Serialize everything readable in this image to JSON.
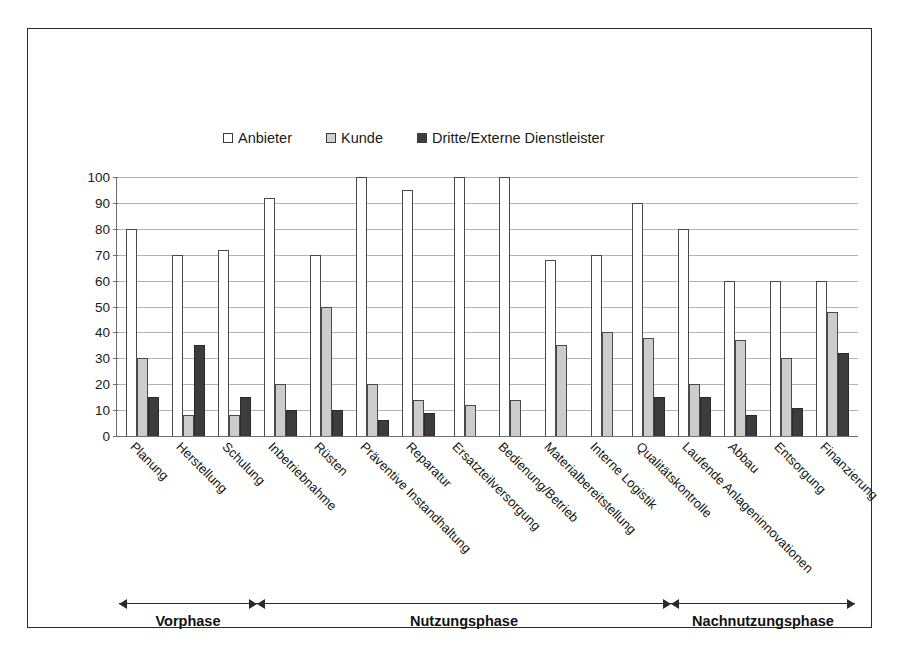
{
  "chart_data": {
    "type": "bar",
    "title": "",
    "xlabel": "",
    "ylabel": "",
    "ylim": [
      0,
      100
    ],
    "yticks": [
      0,
      10,
      20,
      30,
      40,
      50,
      60,
      70,
      80,
      90,
      100
    ],
    "grid": true,
    "legend_position": "top-center",
    "categories": [
      "Planung",
      "Herstellung",
      "Schulung",
      "Inbetriebnahme",
      "Rüsten",
      "Präventive Instandhaltung",
      "Reparatur",
      "Ersatzteilversorgung",
      "Bedienung/Betrieb",
      "Materialbereitstellung",
      "Interne Logistik",
      "Qualitätskontrolle",
      "Laufende Anlageninnovationen",
      "Abbau",
      "Entsorgung",
      "Finanzierung"
    ],
    "series": [
      {
        "name": "Anbieter",
        "color": "#ffffff",
        "values": [
          80,
          70,
          72,
          92,
          70,
          100,
          95,
          100,
          100,
          68,
          70,
          90,
          80,
          60,
          60,
          60
        ]
      },
      {
        "name": "Kunde",
        "color": "#cccccc",
        "values": [
          30,
          8,
          8,
          20,
          50,
          20,
          14,
          12,
          14,
          35,
          40,
          38,
          20,
          37,
          30,
          48
        ]
      },
      {
        "name": "Dritte/Externe Dienstleister",
        "color": "#3c3c3c",
        "values": [
          15,
          35,
          15,
          10,
          10,
          6,
          9,
          0,
          0,
          0,
          0,
          15,
          15,
          8,
          11,
          32
        ]
      }
    ]
  },
  "legend": {
    "items": [
      {
        "label": "Anbieter",
        "swatch": "legend-swatch-white"
      },
      {
        "label": "Kunde",
        "swatch": "legend-swatch-gray"
      },
      {
        "label": "Dritte/Externe Dienstleister",
        "swatch": "legend-swatch-dark"
      }
    ]
  },
  "phases": [
    {
      "label": "Vorphase",
      "start_index": 0,
      "end_index": 2
    },
    {
      "label": "Nutzungsphase",
      "start_index": 3,
      "end_index": 11
    },
    {
      "label": "Nachnutzungsphase",
      "start_index": 12,
      "end_index": 15
    }
  ],
  "colors": {
    "series_anbieter": "#ffffff",
    "series_kunde": "#cccccc",
    "series_dritte": "#3c3c3c",
    "axis": "#6d6d6d",
    "gridline": "#b3b3b3",
    "frame": "#2b2b2b",
    "text": "#161616"
  }
}
